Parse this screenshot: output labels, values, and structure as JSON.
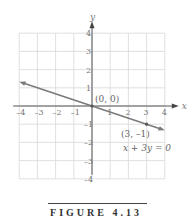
{
  "chart_data": {
    "type": "line",
    "title": "",
    "xlabel": "x",
    "ylabel": "y",
    "xlim": [
      -4,
      4
    ],
    "ylim": [
      -4,
      4
    ],
    "grid": true,
    "x_ticks": [
      "-4",
      "-3",
      "-2",
      "-1",
      "1",
      "2",
      "3",
      "4"
    ],
    "y_ticks": [
      "4",
      "3",
      "2",
      "1",
      "-1",
      "-2",
      "-3",
      "-4"
    ],
    "series": [
      {
        "name": "x + 3y = 0",
        "x": [
          -4,
          0,
          3,
          4
        ],
        "y": [
          1.333,
          0,
          -1,
          -1.333
        ]
      }
    ],
    "points": [
      {
        "label": "(0, 0)",
        "x": 0,
        "y": 0
      },
      {
        "label": "(3, –1)",
        "x": 3,
        "y": -1
      }
    ],
    "annotations": [
      {
        "text": "x + 3y = 0",
        "x": 2.5,
        "y": -2.5
      }
    ],
    "line_color": "#7a7a7a",
    "grid_color": "#d8d8d8"
  },
  "caption": "FIGURE 4.13"
}
